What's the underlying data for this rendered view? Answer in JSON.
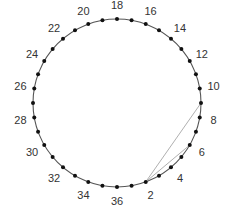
{
  "diagram": {
    "type": "circular-node-diagram",
    "node_count": 36,
    "labeled_nodes": [
      2,
      4,
      6,
      8,
      10,
      12,
      14,
      16,
      18,
      20,
      22,
      24,
      26,
      28,
      30,
      32,
      34,
      36
    ],
    "labels": [
      "2",
      "4",
      "6",
      "8",
      "10",
      "12",
      "14",
      "16",
      "18",
      "20",
      "22",
      "24",
      "26",
      "28",
      "30",
      "32",
      "34",
      "36"
    ],
    "orientation": "node 36 at bottom, 18 at top, numbered counterclockwise",
    "chords": [
      {
        "from": 2,
        "to": 9
      },
      {
        "from": 2,
        "to": 6
      }
    ],
    "colors": {
      "circle": "#555555",
      "dot": "#111111",
      "chord": "#b0b0b0",
      "label": "#333333"
    }
  }
}
